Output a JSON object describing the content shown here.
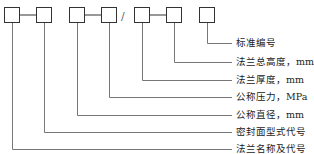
{
  "diagram": {
    "separator": "/",
    "line_color": "#777777",
    "box_color": "#333333",
    "boxes": [
      {
        "x": 4,
        "cx": 12
      },
      {
        "x": 36,
        "cx": 44
      },
      {
        "x": 69,
        "cx": 77
      },
      {
        "x": 101,
        "cx": 109
      },
      {
        "x": 134,
        "cx": 142
      },
      {
        "x": 166,
        "cx": 174
      },
      {
        "x": 199,
        "cx": 207
      }
    ],
    "labels": [
      {
        "text": "标准编号",
        "y": 43,
        "box": 6
      },
      {
        "text": "法兰总高度，mm",
        "y": 62,
        "box": 5
      },
      {
        "text": "法兰厚度，mm",
        "y": 80,
        "box": 4
      },
      {
        "text": "公称压力，MPa",
        "y": 97,
        "box": 3
      },
      {
        "text": "公称直径，mm",
        "y": 115,
        "box": 2
      },
      {
        "text": "密封面型式代号",
        "y": 132,
        "box": 1
      },
      {
        "text": "法兰名称及代号",
        "y": 149,
        "box": 0
      }
    ]
  }
}
